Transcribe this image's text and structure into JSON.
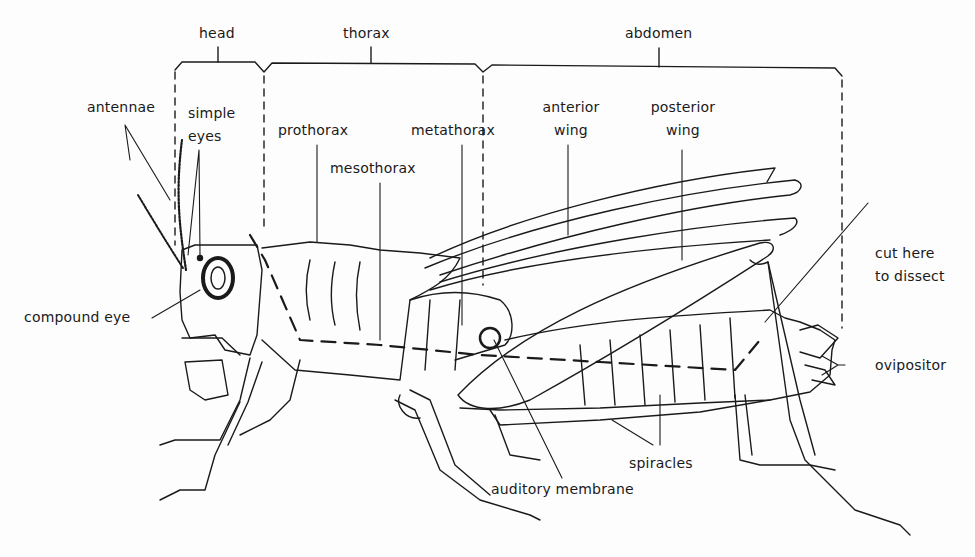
{
  "diagram": {
    "regions": [
      {
        "id": "head",
        "label": "head"
      },
      {
        "id": "thorax",
        "label": "thorax"
      },
      {
        "id": "abdomen",
        "label": "abdomen"
      }
    ],
    "labels": {
      "antennae": "antennae",
      "simple_eyes_1": "simple",
      "simple_eyes_2": "eyes",
      "compound_eye": "compound eye",
      "prothorax": "prothorax",
      "mesothorax": "mesothorax",
      "metathorax": "metathorax",
      "anterior_wing_1": "anterior",
      "anterior_wing_2": "wing",
      "posterior_wing_1": "posterior",
      "posterior_wing_2": "wing",
      "cut_here_1": "cut here",
      "cut_here_2": "to dissect",
      "ovipositor": "ovipositor",
      "spiracles": "spiracles",
      "auditory_membrane": "auditory membrane"
    },
    "colors": {
      "ink": "#1a1a1a",
      "paper": "#fdfdfd"
    }
  }
}
